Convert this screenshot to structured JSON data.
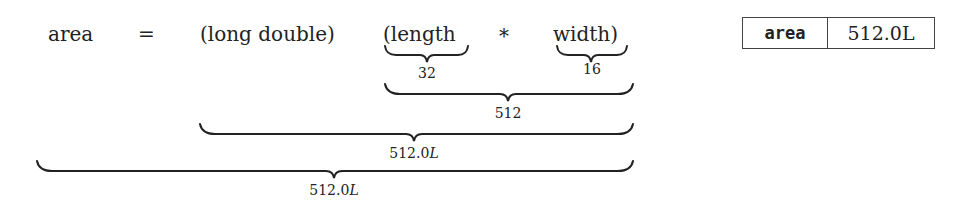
{
  "expression": {
    "lhs": "area",
    "op_assign": "=",
    "cast": "(long double)",
    "open_paren_term": "(length",
    "op_mul": "*",
    "close_paren_term": "width)"
  },
  "annotations": {
    "length_value": "32",
    "width_value": "16",
    "product_value": "512",
    "cast_value": "512.0",
    "cast_suffix": "L",
    "assign_value": "512.0",
    "assign_suffix": "L"
  },
  "result_table": {
    "variable": "area",
    "value": "512.0L"
  },
  "colors": {
    "ink": "#222222",
    "border": "#444444",
    "background": "#ffffff"
  }
}
